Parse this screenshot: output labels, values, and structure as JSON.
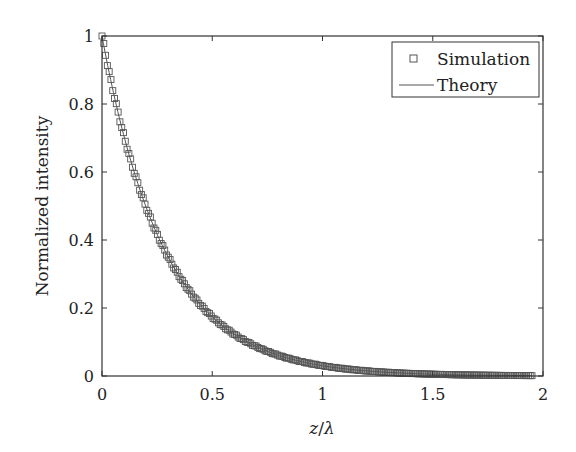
{
  "chart_data": {
    "type": "scatter",
    "title": "",
    "xlabel": "z/λ",
    "xlabel_parts": {
      "var": "z",
      "sep": "/",
      "denom": "λ"
    },
    "ylabel": "Normalized intensity",
    "xlim": [
      0,
      2
    ],
    "ylim": [
      0,
      1
    ],
    "xticks": [
      0,
      0.5,
      1,
      1.5,
      2
    ],
    "xtick_labels": [
      "0",
      "0.5",
      "1",
      "1.5",
      "2"
    ],
    "yticks": [
      0,
      0.2,
      0.4,
      0.6,
      0.8,
      1
    ],
    "ytick_labels": [
      "0",
      "0.2",
      "0.4",
      "0.6",
      "0.8",
      "1"
    ],
    "grid": false,
    "legend_position": "upper right",
    "legend": [
      "Simulation",
      "Theory"
    ],
    "series": [
      {
        "name": "Simulation",
        "style": "open-square-markers",
        "x": [
          0.0,
          0.05,
          0.1,
          0.15,
          0.2,
          0.25,
          0.3,
          0.35,
          0.4,
          0.45,
          0.5,
          0.6,
          0.7,
          0.8,
          0.9,
          1.0,
          1.1,
          1.2,
          1.3,
          1.4,
          1.5,
          1.6,
          1.7,
          1.8,
          1.9,
          1.95
        ],
        "y": [
          1.0,
          0.84,
          0.7,
          0.59,
          0.5,
          0.42,
          0.35,
          0.29,
          0.25,
          0.21,
          0.17,
          0.12,
          0.086,
          0.061,
          0.043,
          0.03,
          0.021,
          0.015,
          0.011,
          0.0074,
          0.0052,
          0.0037,
          0.0026,
          0.0018,
          0.0013,
          0.0011
        ]
      },
      {
        "name": "Theory",
        "style": "solid-line",
        "formula": "exp(-3.5 z/λ)",
        "x": [
          0.0,
          0.1,
          0.2,
          0.3,
          0.4,
          0.5,
          0.75,
          1.0,
          1.25,
          1.5,
          1.75,
          1.95
        ],
        "y": [
          1.0,
          0.7,
          0.5,
          0.35,
          0.25,
          0.17,
          0.072,
          0.03,
          0.013,
          0.0052,
          0.0022,
          0.0011
        ]
      }
    ],
    "colors": {
      "axes": "#333333",
      "markers": "#555555",
      "line": "#555555"
    }
  }
}
